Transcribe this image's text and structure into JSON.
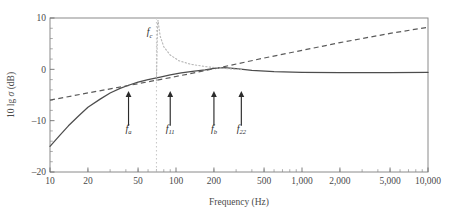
{
  "chart_data": {
    "type": "line",
    "title": "",
    "xlabel": "Frequency (Hz)",
    "ylabel": "10 lg σ (dB)",
    "xscale": "log",
    "xlim": [
      10,
      10000
    ],
    "ylim": [
      -20,
      10
    ],
    "grid": false,
    "legend": null,
    "xticks": [
      10,
      20,
      50,
      100,
      200,
      500,
      1000,
      2000,
      5000,
      10000
    ],
    "xtick_labels": [
      "10",
      "20",
      "50",
      "100",
      "200",
      "500",
      "1,000",
      "2,000",
      "5,000",
      "10,000"
    ],
    "yticks": [
      -20,
      -10,
      0,
      10
    ],
    "ytick_labels": [
      "–20",
      "–10",
      "0",
      "10"
    ],
    "ytick_minor": [
      -18,
      -16,
      -14,
      -12,
      -8,
      -6,
      -4,
      -2,
      2,
      4,
      6,
      8
    ],
    "series": [
      {
        "name": "measured-response",
        "style": "solid",
        "color": "#4d4d4d",
        "points": [
          [
            10,
            -15.0
          ],
          [
            12,
            -12.8
          ],
          [
            14,
            -11.0
          ],
          [
            17,
            -9.0
          ],
          [
            20,
            -7.4
          ],
          [
            25,
            -5.8
          ],
          [
            30,
            -4.6
          ],
          [
            36,
            -3.7
          ],
          [
            42,
            -3.1
          ],
          [
            50,
            -2.5
          ],
          [
            60,
            -2.0
          ],
          [
            75,
            -1.5
          ],
          [
            90,
            -1.1
          ],
          [
            110,
            -0.7
          ],
          [
            140,
            -0.35
          ],
          [
            170,
            -0.1
          ],
          [
            200,
            0.2
          ],
          [
            240,
            0.35
          ],
          [
            300,
            0.15
          ],
          [
            400,
            -0.2
          ],
          [
            600,
            -0.45
          ],
          [
            1000,
            -0.6
          ],
          [
            2000,
            -0.65
          ],
          [
            5000,
            -0.65
          ],
          [
            10000,
            -0.6
          ]
        ]
      },
      {
        "name": "theoretical-asymptote",
        "style": "dashed",
        "color": "#5a5a5a",
        "points": [
          [
            10,
            -6.0
          ],
          [
            20,
            -4.6
          ],
          [
            50,
            -2.8
          ],
          [
            100,
            -1.4
          ],
          [
            200,
            0.1
          ],
          [
            500,
            2.2
          ],
          [
            1000,
            3.7
          ],
          [
            2000,
            5.2
          ],
          [
            5000,
            7.0
          ],
          [
            10000,
            8.2
          ]
        ]
      },
      {
        "name": "resonance-peak",
        "style": "dotted",
        "color": "#b9b9b9",
        "points": [
          [
            70,
            -2.2
          ],
          [
            70.5,
            2.0
          ],
          [
            71,
            6.0
          ],
          [
            71.5,
            9.0
          ],
          [
            72,
            9.6
          ],
          [
            73,
            8.4
          ],
          [
            75,
            6.4
          ],
          [
            80,
            4.4
          ],
          [
            90,
            2.8
          ],
          [
            105,
            1.7
          ],
          [
            130,
            1.0
          ],
          [
            170,
            0.55
          ],
          [
            220,
            0.25
          ],
          [
            280,
            0.05
          ],
          [
            330,
            -0.05
          ]
        ]
      }
    ],
    "vertical_lines": [
      {
        "name": "fc-line",
        "x": 70,
        "style": "dotted",
        "color": "#c9c9c9"
      }
    ],
    "annotations": [
      {
        "name": "fc",
        "base": "f",
        "sub": "c",
        "x": 70,
        "y": 6.6,
        "kind": "label",
        "align": "right"
      },
      {
        "name": "fa",
        "base": "f",
        "sub": "a",
        "x": 42,
        "y": -12.2,
        "kind": "arrow",
        "arrow_from": -11.0,
        "arrow_to": -4.2
      },
      {
        "name": "f11",
        "base": "f",
        "sub": "11",
        "x": 90,
        "y": -12.2,
        "kind": "arrow",
        "arrow_from": -11.0,
        "arrow_to": -4.2
      },
      {
        "name": "fb",
        "base": "f",
        "sub": "b",
        "x": 200,
        "y": -12.2,
        "kind": "arrow",
        "arrow_from": -11.0,
        "arrow_to": -4.2
      },
      {
        "name": "f22",
        "base": "f",
        "sub": "22",
        "x": 330,
        "y": -12.2,
        "kind": "arrow",
        "arrow_from": -11.0,
        "arrow_to": -4.2
      }
    ]
  },
  "axis": {
    "x_title": "Frequency (Hz)",
    "y_title_prefix": "10 lg ",
    "y_title_symbol": "σ",
    "y_title_suffix": " (dB)"
  },
  "labels": {
    "x0": "10",
    "x1": "20",
    "x2": "50",
    "x3": "100",
    "x4": "200",
    "x5": "500",
    "x6": "1,000",
    "x7": "2,000",
    "x8": "5,000",
    "x9": "10,000",
    "y0": "–20",
    "y1": "–10",
    "y2": "0",
    "y3": "10",
    "fc_base": "f",
    "fc_sub": "c",
    "fa_base": "f",
    "fa_sub": "a",
    "f11_base": "f",
    "f11_sub": "11",
    "fb_base": "f",
    "fb_sub": "b",
    "f22_base": "f",
    "f22_sub": "22"
  }
}
